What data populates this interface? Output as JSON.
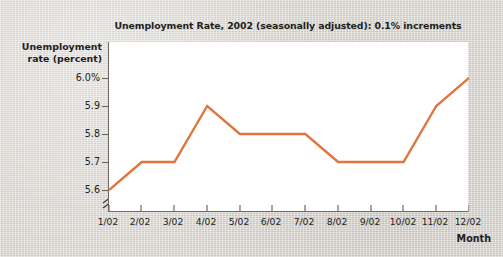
{
  "chart_data": {
    "type": "line",
    "title": "Unemployment Rate, 2002 (seasonally adjusted): 0.1% increments",
    "xlabel": "Month",
    "ylabel": "Unemployment rate (percent)",
    "ylabel_line1": "Unemployment",
    "ylabel_line2": "rate (percent)",
    "categories": [
      "1/02",
      "2/02",
      "3/02",
      "4/02",
      "5/02",
      "6/02",
      "7/02",
      "8/02",
      "9/02",
      "10/02",
      "11/02",
      "12/02"
    ],
    "values": [
      5.6,
      5.7,
      5.7,
      5.9,
      5.8,
      5.8,
      5.8,
      5.7,
      5.7,
      5.7,
      5.9,
      6.0
    ],
    "series": [
      {
        "name": "Unemployment rate",
        "values": [
          5.6,
          5.7,
          5.7,
          5.9,
          5.8,
          5.8,
          5.8,
          5.7,
          5.7,
          5.7,
          5.9,
          6.0
        ]
      }
    ],
    "ylim": [
      5.6,
      6.0
    ],
    "ytick_values": [
      6.0,
      5.9,
      5.8,
      5.7,
      5.6
    ],
    "ytick_labels": [
      "6.0%",
      "5.9",
      "5.8",
      "5.7",
      "5.6"
    ],
    "xtick_labels": [
      "1/02",
      "2/02",
      "3/02",
      "4/02",
      "5/02",
      "6/02",
      "7/02",
      "8/02",
      "9/02",
      "10/02",
      "11/02",
      "12/02"
    ],
    "grid": false,
    "legend": false,
    "y_axis_break": true,
    "line_color": "#e0763f",
    "plot_background": "#ffffff",
    "page_background": "#d9d4cd",
    "axis_color": "#6f6a64",
    "text_color": "#231f1c"
  }
}
